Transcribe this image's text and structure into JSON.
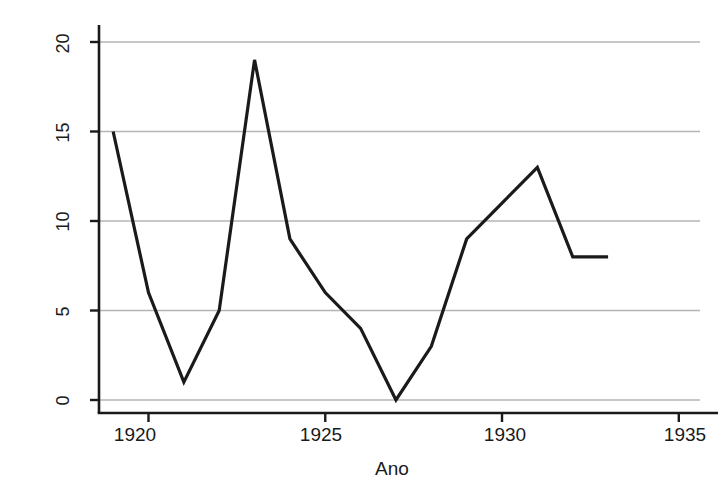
{
  "chart_data": {
    "type": "line",
    "title": "",
    "subtitle": "",
    "xlabel": "Ano",
    "ylabel": "Agitação",
    "x": [
      1919,
      1920,
      1921,
      1922,
      1923,
      1924,
      1925,
      1926,
      1927,
      1928,
      1929,
      1930,
      1931,
      1932,
      1933
    ],
    "values": [
      15,
      6,
      1,
      5,
      19,
      9,
      6,
      4,
      0,
      3,
      9,
      11,
      13,
      8,
      8
    ],
    "series": [
      {
        "name": "Agitação",
        "values": [
          15,
          6,
          1,
          5,
          19,
          9,
          6,
          4,
          0,
          3,
          9,
          11,
          13,
          8,
          8
        ]
      }
    ],
    "xlim": [
      1918.6,
      1935.6
    ],
    "ylim": [
      0,
      20
    ],
    "xticks": [
      1920,
      1925,
      1930,
      1935
    ],
    "xtick_labels": [
      "1920",
      "1925",
      "1930",
      "1935"
    ],
    "yticks": [
      0,
      5,
      10,
      15,
      20
    ],
    "ytick_labels": [
      "0",
      "5",
      "10",
      "15",
      "20"
    ],
    "grid": "horizontal",
    "legend": "none",
    "line_color": "#1a1a1a",
    "grid_color": "#b4b4b4",
    "axis_color": "#1a1a1a",
    "background": "#ffffff",
    "annotations": []
  },
  "axes": {
    "y_title": "Agitação",
    "x_title": "Ano"
  },
  "ytick_labels": [
    "0",
    "5",
    "10",
    "15",
    "20"
  ],
  "xtick_labels": [
    "1920",
    "1925",
    "1930",
    "1935"
  ]
}
